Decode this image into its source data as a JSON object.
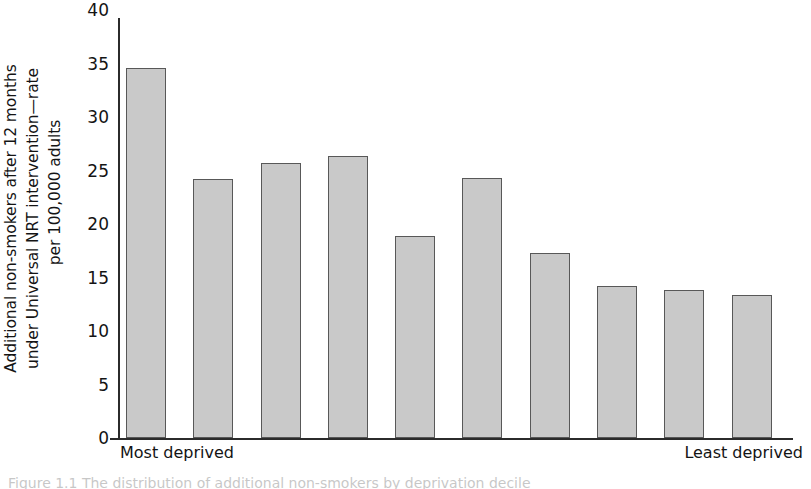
{
  "chart_data": {
    "type": "bar",
    "title": "",
    "xlabel": "",
    "ylabel": "Additional non-smokers after 12 months under Universal NRT intervention—rate per 100,000 adults",
    "ylabel_lines": [
      "Additional non-smokers after 12 months",
      "under Universal NRT intervention—rate",
      "per 100,000 adults"
    ],
    "categories": [
      "1",
      "2",
      "3",
      "4",
      "5",
      "6",
      "7",
      "8",
      "9",
      "10"
    ],
    "values": [
      35.2,
      24.7,
      26.2,
      26.9,
      19.2,
      24.8,
      17.6,
      14.5,
      14.1,
      13.6
    ],
    "ylim": [
      0,
      40
    ],
    "yticks": [
      0,
      5,
      10,
      15,
      20,
      25,
      30,
      35,
      40
    ],
    "ytick_labels": [
      "0",
      "5",
      "10",
      "15",
      "20",
      "25",
      "30",
      "35",
      "40"
    ],
    "grid": false,
    "legend": null,
    "bar_color": "#c9c9c9",
    "bar_edge_color": "#585858",
    "axis_color": "#2b2b2b",
    "x_axis_end_labels": {
      "left": "Most deprived",
      "right": "Least deprived"
    }
  },
  "caption": {
    "text": "Figure 1.1 The distribution of additional non-smokers by deprivation decile"
  }
}
